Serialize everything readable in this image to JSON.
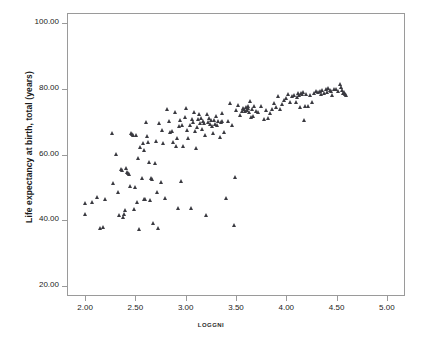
{
  "chart": {
    "type": "scatter",
    "title": "",
    "xlabel": "LOGGNI",
    "ylabel": "Life expectancy at birth, total (years)",
    "marker": "triangle",
    "marker_color": "#3a3a40",
    "grid": false,
    "legend": false,
    "frame": true,
    "xlim": [
      1.82,
      5.18
    ],
    "ylim": [
      17.0,
      103.0
    ],
    "xticks": [
      "2.00",
      "2.50",
      "3.00",
      "3.50",
      "4.00",
      "4.50",
      "5.00"
    ],
    "xtick_values": [
      2.0,
      2.5,
      3.0,
      3.5,
      4.0,
      4.5,
      5.0
    ],
    "yticks": [
      "20.00",
      "40.00",
      "60.00",
      "80.00",
      "100.00"
    ],
    "ytick_values": [
      20,
      40,
      60,
      80,
      100
    ]
  },
  "chart_data": {
    "type": "scatter",
    "title": "",
    "xlabel": "LOGGNI",
    "ylabel": "Life expectancy at birth, total (years)",
    "xlim": [
      1.82,
      5.18
    ],
    "ylim": [
      17.0,
      103.0
    ],
    "xticks": [
      2.0,
      2.5,
      3.0,
      3.5,
      4.0,
      4.5,
      5.0
    ],
    "yticks": [
      20,
      40,
      60,
      80,
      100
    ],
    "grid": false,
    "legend": false,
    "series": [
      {
        "name": "countries",
        "marker": "triangle",
        "color": "#3a3a40",
        "points": [
          [
            2.0,
            45.3
          ],
          [
            2.0,
            42.0
          ],
          [
            2.07,
            45.6
          ],
          [
            2.12,
            47.2
          ],
          [
            2.15,
            37.7
          ],
          [
            2.18,
            37.8
          ],
          [
            2.2,
            46.4
          ],
          [
            2.27,
            66.6
          ],
          [
            2.28,
            51.3
          ],
          [
            2.31,
            60.0
          ],
          [
            2.33,
            48.7
          ],
          [
            2.34,
            41.5
          ],
          [
            2.36,
            55.7
          ],
          [
            2.37,
            55.2
          ],
          [
            2.38,
            41.0
          ],
          [
            2.39,
            42.0
          ],
          [
            2.4,
            43.0
          ],
          [
            2.42,
            54.7
          ],
          [
            2.43,
            54.3
          ],
          [
            2.44,
            53.9
          ],
          [
            2.45,
            50.5
          ],
          [
            2.46,
            66.5
          ],
          [
            2.47,
            66.2
          ],
          [
            2.48,
            65.8
          ],
          [
            2.49,
            43.5
          ],
          [
            2.5,
            50.0
          ],
          [
            2.52,
            45.4
          ],
          [
            2.53,
            58.8
          ],
          [
            2.54,
            37.2
          ],
          [
            2.55,
            62.3
          ],
          [
            2.57,
            52.7
          ],
          [
            2.58,
            63.5
          ],
          [
            2.59,
            61.4
          ],
          [
            2.6,
            46.4
          ],
          [
            2.61,
            69.8
          ],
          [
            2.62,
            65.6
          ],
          [
            2.63,
            63.8
          ],
          [
            2.64,
            57.6
          ],
          [
            2.65,
            46.0
          ],
          [
            2.66,
            52.8
          ],
          [
            2.67,
            52.6
          ],
          [
            2.68,
            39.2
          ],
          [
            2.7,
            57.5
          ],
          [
            2.71,
            64.0
          ],
          [
            2.72,
            48.5
          ],
          [
            2.73,
            37.7
          ],
          [
            2.74,
            69.6
          ],
          [
            2.76,
            51.5
          ],
          [
            2.78,
            63.6
          ],
          [
            2.8,
            46.8
          ],
          [
            2.82,
            73.7
          ],
          [
            2.85,
            66.8
          ],
          [
            2.87,
            67.0
          ],
          [
            2.88,
            63.9
          ],
          [
            2.9,
            72.8
          ],
          [
            2.91,
            62.6
          ],
          [
            2.92,
            64.9
          ],
          [
            2.93,
            43.6
          ],
          [
            2.94,
            68.6
          ],
          [
            2.95,
            70.5
          ],
          [
            2.96,
            52.0
          ],
          [
            2.97,
            68.8
          ],
          [
            2.98,
            62.7
          ],
          [
            3.0,
            71.5
          ],
          [
            3.02,
            67.4
          ],
          [
            3.03,
            65.0
          ],
          [
            3.05,
            69.0
          ],
          [
            3.06,
            43.8
          ],
          [
            3.07,
            70.7
          ],
          [
            3.08,
            69.7
          ],
          [
            3.09,
            72.9
          ],
          [
            3.1,
            67.2
          ],
          [
            3.11,
            62.0
          ],
          [
            3.12,
            68.3
          ],
          [
            3.13,
            70.9
          ],
          [
            3.14,
            72.4
          ],
          [
            3.15,
            69.4
          ],
          [
            3.16,
            71.0
          ],
          [
            3.17,
            67.8
          ],
          [
            3.18,
            70.2
          ],
          [
            3.19,
            69.5
          ],
          [
            3.2,
            65.8
          ],
          [
            3.21,
            41.7
          ],
          [
            3.22,
            72.3
          ],
          [
            3.23,
            69.9
          ],
          [
            3.24,
            71.1
          ],
          [
            3.25,
            69.2
          ],
          [
            3.26,
            70.4
          ],
          [
            3.27,
            68.7
          ],
          [
            3.28,
            66.4
          ],
          [
            3.29,
            70.6
          ],
          [
            3.3,
            69.3
          ],
          [
            3.31,
            71.6
          ],
          [
            3.32,
            68.9
          ],
          [
            3.33,
            70.0
          ],
          [
            3.34,
            65.4
          ],
          [
            3.35,
            69.8
          ],
          [
            3.36,
            70.3
          ],
          [
            3.38,
            66.9
          ],
          [
            3.4,
            46.7
          ],
          [
            3.42,
            70.1
          ],
          [
            3.44,
            75.5
          ],
          [
            3.46,
            68.8
          ],
          [
            3.48,
            38.5
          ],
          [
            3.49,
            53.1
          ],
          [
            3.5,
            73.6
          ],
          [
            3.52,
            74.9
          ],
          [
            3.54,
            72.0
          ],
          [
            3.56,
            73.1
          ],
          [
            3.57,
            74.0
          ],
          [
            3.58,
            73.8
          ],
          [
            3.59,
            73.3
          ],
          [
            3.6,
            74.4
          ],
          [
            3.61,
            73.5
          ],
          [
            3.62,
            74.2
          ],
          [
            3.63,
            73.0
          ],
          [
            3.64,
            76.2
          ],
          [
            3.65,
            71.3
          ],
          [
            3.66,
            73.9
          ],
          [
            3.67,
            71.6
          ],
          [
            3.68,
            74.6
          ],
          [
            3.7,
            73.2
          ],
          [
            3.72,
            72.8
          ],
          [
            3.75,
            74.8
          ],
          [
            3.78,
            70.9
          ],
          [
            3.8,
            73.4
          ],
          [
            3.82,
            71.0
          ],
          [
            3.84,
            72.6
          ],
          [
            3.86,
            73.7
          ],
          [
            3.88,
            75.6
          ],
          [
            3.9,
            74.3
          ],
          [
            3.92,
            77.6
          ],
          [
            3.94,
            73.9
          ],
          [
            3.96,
            75.2
          ],
          [
            3.98,
            76.4
          ],
          [
            4.0,
            77.1
          ],
          [
            4.02,
            78.4
          ],
          [
            4.04,
            75.8
          ],
          [
            4.06,
            77.8
          ],
          [
            4.08,
            78.2
          ],
          [
            4.1,
            76.0
          ],
          [
            4.12,
            78.6
          ],
          [
            4.13,
            78.0
          ],
          [
            4.14,
            74.4
          ],
          [
            4.15,
            78.8
          ],
          [
            4.16,
            78.3
          ],
          [
            4.17,
            79.0
          ],
          [
            4.18,
            70.4
          ],
          [
            4.19,
            74.6
          ],
          [
            4.2,
            78.5
          ],
          [
            4.22,
            74.8
          ],
          [
            4.24,
            78.1
          ],
          [
            4.26,
            75.9
          ],
          [
            4.28,
            78.7
          ],
          [
            4.3,
            79.2
          ],
          [
            4.32,
            78.9
          ],
          [
            4.34,
            79.4
          ],
          [
            4.35,
            78.3
          ],
          [
            4.36,
            79.6
          ],
          [
            4.38,
            78.8
          ],
          [
            4.4,
            79.8
          ],
          [
            4.41,
            79.1
          ],
          [
            4.42,
            80.2
          ],
          [
            4.44,
            79.5
          ],
          [
            4.46,
            78.0
          ],
          [
            4.48,
            79.9
          ],
          [
            4.5,
            80.0
          ],
          [
            4.52,
            79.3
          ],
          [
            4.54,
            81.5
          ],
          [
            4.55,
            80.4
          ],
          [
            4.56,
            79.7
          ],
          [
            4.57,
            78.6
          ],
          [
            4.58,
            79.0
          ],
          [
            4.59,
            78.4
          ],
          [
            4.6,
            78.2
          ],
          [
            2.41,
            56.0
          ],
          [
            2.51,
            65.9
          ],
          [
            2.59,
            46.5
          ],
          [
            2.77,
            67.3
          ],
          [
            2.84,
            70.3
          ],
          [
            3.01,
            74.2
          ],
          [
            3.36,
            72.5
          ],
          [
            3.62,
            74.8
          ],
          [
            4.11,
            77.3
          ],
          [
            4.45,
            79.2
          ]
        ]
      }
    ]
  }
}
